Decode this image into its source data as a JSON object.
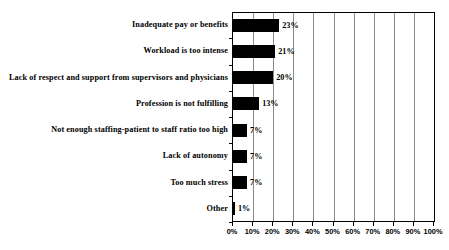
{
  "chart_data": {
    "type": "bar",
    "orientation": "horizontal",
    "title": "",
    "subtitle": "",
    "xlabel": "",
    "ylabel": "",
    "xlim": [
      0,
      100
    ],
    "grid": true,
    "legend": null,
    "categories": [
      "Inadequate pay or benefits",
      "Workload is too intense",
      "Lack of respect and support from supervisors and physicians",
      "Profession is not fulfilling",
      "Not enough staffing-patient to staff ratio too high",
      "Lack of autonomy",
      "Too much stress",
      "Other"
    ],
    "values": [
      23,
      21,
      20,
      13,
      7,
      7,
      7,
      1
    ],
    "data_labels": [
      "23%",
      "21%",
      "20%",
      "13%",
      "7%",
      "7%",
      "7%",
      "1%"
    ],
    "xticks": [
      0,
      10,
      20,
      30,
      40,
      50,
      60,
      70,
      80,
      90,
      100
    ],
    "xticklabels": [
      "0%",
      "10%",
      "20%",
      "30%",
      "40%",
      "50%",
      "60%",
      "70%",
      "80%",
      "90%",
      "100%"
    ],
    "bar_color": "#000000",
    "plot_border_color": "#000000",
    "gridline_color": "#8a8a8a",
    "background_color": "#ffffff"
  }
}
